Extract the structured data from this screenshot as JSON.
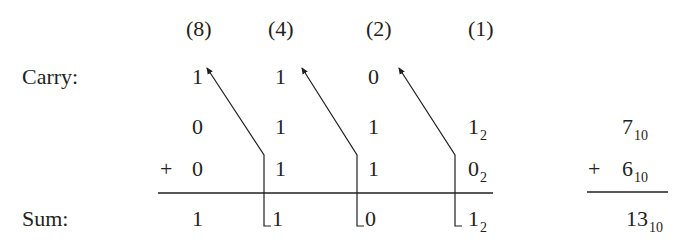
{
  "diagram": {
    "title": "",
    "place_values": [
      "(8)",
      "(4)",
      "(2)",
      "(1)"
    ],
    "row_labels": {
      "carry": "Carry:",
      "sum": "Sum:"
    },
    "binary": {
      "carry": [
        "1",
        "1",
        "0"
      ],
      "addend1": {
        "digits": [
          "0",
          "1",
          "1",
          "1"
        ],
        "base": "2"
      },
      "addend2": {
        "sign": "+",
        "digits": [
          "0",
          "1",
          "1",
          "0"
        ],
        "base": "2"
      },
      "sum": {
        "digits": [
          "1",
          "1",
          "0",
          "1"
        ],
        "base": "2"
      }
    },
    "decimal": {
      "addend1": {
        "value": "7",
        "base": "10"
      },
      "addend2": {
        "sign": "+",
        "value": "6",
        "base": "10"
      },
      "sum": {
        "value": "13",
        "base": "10"
      }
    },
    "arrows": [
      {
        "from_column": "(4)",
        "to_column": "(8)",
        "meaning": "carry"
      },
      {
        "from_column": "(2)",
        "to_column": "(4)",
        "meaning": "carry"
      },
      {
        "from_column": "(1)",
        "to_column": "(2)",
        "meaning": "carry"
      }
    ],
    "colors": {
      "ink": "#231f20",
      "background": "#ffffff"
    }
  }
}
